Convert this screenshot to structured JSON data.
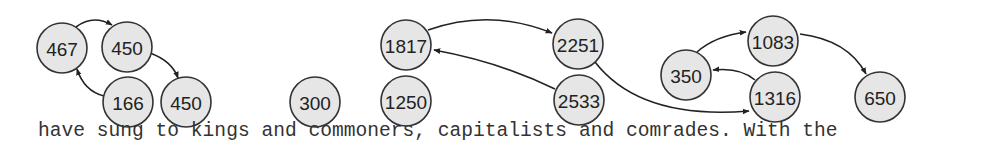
{
  "diagram": {
    "node_radius": 25,
    "colors": {
      "node_fill": "#e6e6e6",
      "node_stroke": "#333333",
      "edge": "#222222",
      "text": "#222222"
    },
    "nodes": [
      {
        "id": "n467",
        "label": "467",
        "x": 62,
        "y": 48
      },
      {
        "id": "n450a",
        "label": "450",
        "x": 127,
        "y": 47
      },
      {
        "id": "n166",
        "label": "166",
        "x": 128,
        "y": 102
      },
      {
        "id": "n450b",
        "label": "450",
        "x": 186,
        "y": 102
      },
      {
        "id": "n300",
        "label": "300",
        "x": 315,
        "y": 102
      },
      {
        "id": "n1250",
        "label": "1250",
        "x": 406,
        "y": 101
      },
      {
        "id": "n1817",
        "label": "1817",
        "x": 406,
        "y": 45
      },
      {
        "id": "n2251",
        "label": "2251",
        "x": 578,
        "y": 44
      },
      {
        "id": "n2533",
        "label": "2533",
        "x": 579,
        "y": 100
      },
      {
        "id": "n350",
        "label": "350",
        "x": 686,
        "y": 75
      },
      {
        "id": "n1083",
        "label": "1083",
        "x": 773,
        "y": 41
      },
      {
        "id": "n1316",
        "label": "1316",
        "x": 775,
        "y": 97
      },
      {
        "id": "n650",
        "label": "650",
        "x": 880,
        "y": 97
      }
    ],
    "edges": [
      {
        "from": "n467",
        "to": "n450a",
        "path": "M 76 27 Q 93 14 112 25"
      },
      {
        "from": "n450a",
        "to": "n450b",
        "path": "M 150 53 Q 172 61 178 78"
      },
      {
        "from": "n166",
        "to": "n467",
        "path": "M 104 96 Q 84 91 77 69"
      },
      {
        "from": "n1817",
        "to": "n2251",
        "path": "M 428 30 Q 490 8 552 33"
      },
      {
        "from": "n2533",
        "to": "n1817",
        "path": "M 555 89 Q 500 62 434 50"
      },
      {
        "from": "n2251",
        "to": "n1316",
        "path": "M 595 62 Q 640 120 749 111"
      },
      {
        "from": "n350",
        "to": "n1083",
        "path": "M 697 52 Q 715 36 746 32"
      },
      {
        "from": "n1316",
        "to": "n350",
        "path": "M 755 80 Q 740 67 713 70"
      },
      {
        "from": "n1083",
        "to": "n650",
        "path": "M 800 34 Q 848 40 866 74"
      }
    ]
  },
  "caption": {
    "text": "have sung to kings and commoners, capitalists and comrades. With the"
  }
}
